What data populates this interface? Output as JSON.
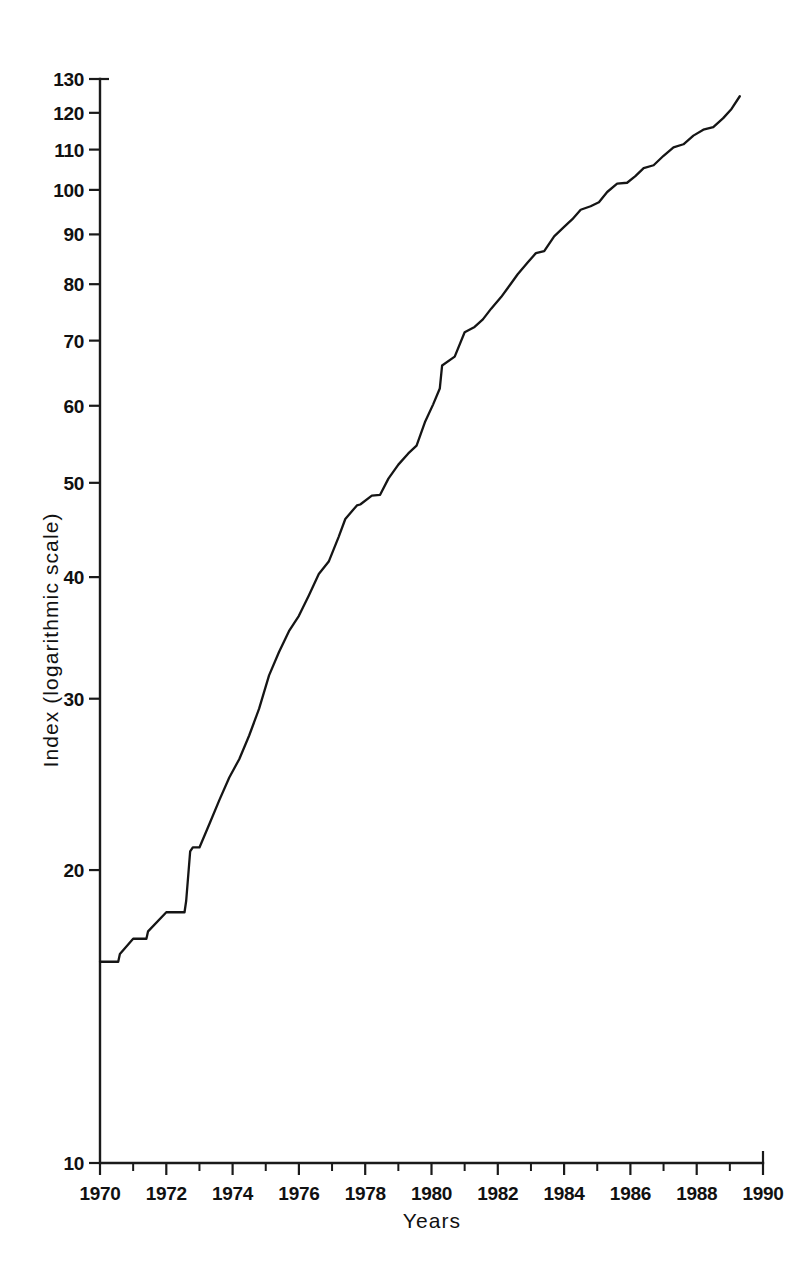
{
  "chart_data": {
    "type": "line",
    "title": "",
    "xlabel": "Years",
    "ylabel": "Index (logarithmic scale)",
    "yscale": "log",
    "xscale": "linear",
    "xlim": [
      1970,
      1990
    ],
    "ylim": [
      10,
      130
    ],
    "grid": false,
    "legend": null,
    "y_tick_labels": [
      "130",
      "120",
      "110",
      "100",
      "90",
      "80",
      "70",
      "60",
      "50",
      "40",
      "30",
      "20",
      "10"
    ],
    "y_ticks": [
      130,
      120,
      110,
      100,
      90,
      80,
      70,
      60,
      50,
      40,
      30,
      20,
      10
    ],
    "x_tick_labels": [
      "1970",
      "1972",
      "1974",
      "1976",
      "1978",
      "1980",
      "1982",
      "1984",
      "1986",
      "1988",
      "1990"
    ],
    "x_ticks": [
      1970,
      1972,
      1974,
      1976,
      1978,
      1980,
      1982,
      1984,
      1986,
      1988,
      1990
    ],
    "x_minor_ticks": [
      1971,
      1973,
      1975,
      1977,
      1979,
      1981,
      1983,
      1985,
      1987,
      1989
    ],
    "series": [
      {
        "name": "Index",
        "x": [
          1970.0,
          1970.55,
          1970.6,
          1971.0,
          1971.4,
          1971.45,
          1972.0,
          1972.55,
          1972.6,
          1972.72,
          1972.8,
          1973.0,
          1973.3,
          1973.6,
          1973.9,
          1974.2,
          1974.5,
          1974.8,
          1975.1,
          1975.4,
          1975.7,
          1976.0,
          1976.3,
          1976.6,
          1976.9,
          1977.2,
          1977.4,
          1977.75,
          1977.85,
          1978.2,
          1978.45,
          1978.7,
          1979.0,
          1979.3,
          1979.55,
          1979.8,
          1980.05,
          1980.25,
          1980.32,
          1980.7,
          1981.0,
          1981.3,
          1981.55,
          1981.8,
          1982.1,
          1982.35,
          1982.6,
          1982.9,
          1983.15,
          1983.4,
          1983.7,
          1984.0,
          1984.25,
          1984.5,
          1984.8,
          1985.05,
          1985.3,
          1985.6,
          1985.9,
          1986.15,
          1986.4,
          1986.7,
          1987.0,
          1987.3,
          1987.6,
          1987.9,
          1988.2,
          1988.5,
          1988.8,
          1989.05,
          1989.3
        ],
        "y": [
          16.1,
          16.1,
          16.4,
          17.0,
          17.0,
          17.3,
          18.1,
          18.1,
          18.6,
          20.9,
          21.1,
          21.1,
          22.3,
          23.6,
          24.9,
          26.0,
          27.5,
          29.3,
          31.7,
          33.5,
          35.2,
          36.5,
          38.3,
          40.3,
          41.5,
          44.0,
          45.9,
          47.4,
          47.5,
          48.5,
          48.6,
          50.5,
          52.2,
          53.6,
          54.6,
          57.7,
          60.2,
          62.5,
          66.0,
          67.4,
          71.4,
          72.3,
          73.6,
          75.5,
          77.6,
          79.7,
          81.9,
          84.2,
          86.1,
          86.5,
          89.6,
          91.6,
          93.3,
          95.4,
          96.2,
          97.1,
          99.5,
          101.5,
          101.7,
          103.3,
          105.3,
          106.0,
          108.4,
          110.6,
          111.4,
          113.7,
          115.3,
          116.0,
          118.5,
          121.1,
          124.8
        ]
      }
    ]
  }
}
